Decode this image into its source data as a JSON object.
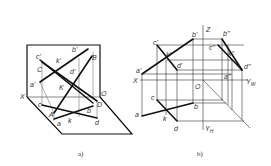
{
  "figure_a": {
    "caption": "a)",
    "labels": {
      "c_prime": "c'",
      "b_prime": "b'",
      "B": "B",
      "C": "C",
      "k_prime": "k'",
      "d_prime": "d'",
      "a_prime": "a'",
      "K": "K",
      "X": "X",
      "O": "O",
      "c": "c",
      "A": "A",
      "D": "D",
      "b": "b",
      "a": "a",
      "k": "k",
      "d": "d"
    }
  },
  "figure_b": {
    "caption": "b)",
    "labels": {
      "Z": "Z",
      "b_dprime": "b\"",
      "c_prime": "c'",
      "b_prime": "b'",
      "c_dprime": "c\"",
      "k_prime": "k'",
      "k_dprime": "k\"",
      "a_prime": "a'",
      "d_prime": "d'",
      "d_dprime": "d\"",
      "a_dprime": "a\"",
      "X": "X",
      "O": "O",
      "Y_W": "Y",
      "Y_W_sub": "W",
      "c": "c",
      "b": "b",
      "a": "a",
      "k": "k",
      "d": "d",
      "Y_H": "Y",
      "Y_H_sub": "H"
    }
  }
}
